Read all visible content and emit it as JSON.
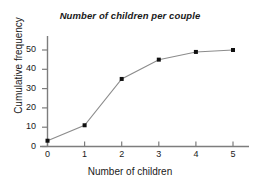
{
  "chart_data": {
    "type": "line",
    "title": "Number of children per couple",
    "xlabel": "Number of children",
    "ylabel": "Cumulative frequency",
    "x": [
      0,
      1,
      2,
      3,
      4,
      5
    ],
    "values": [
      3,
      11,
      35,
      45,
      49,
      50
    ],
    "series": [
      {
        "name": "Cumulative frequency",
        "values": [
          3,
          11,
          35,
          45,
          49,
          50
        ]
      }
    ],
    "xticks": [
      0,
      1,
      2,
      3,
      4,
      5
    ],
    "xtick_labels": [
      "0",
      "1",
      "2",
      "3",
      "4",
      "5"
    ],
    "yticks": [
      0,
      10,
      20,
      30,
      40,
      50
    ],
    "ytick_labels": [
      "0",
      "10",
      "20",
      "30",
      "40",
      "50"
    ],
    "xlim": [
      0,
      5.3
    ],
    "ylim": [
      0,
      55
    ],
    "grid": false,
    "legend": false,
    "marker": "square",
    "marker_color": "#101010",
    "line_color": "#8c8c8c",
    "axis_color": "#7d7d7d",
    "background_color": "#ffffff",
    "text_color": "#1a1a1a"
  }
}
